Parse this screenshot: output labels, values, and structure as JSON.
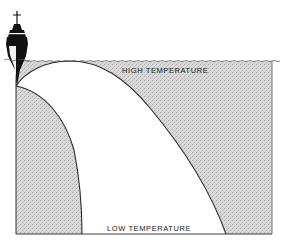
{
  "diagram": {
    "type": "sound-propagation-sketch",
    "labels": {
      "high_temperature": "HIGH TEMPERATURE",
      "low_temperature": "LOW TEMPERATURE"
    },
    "icons": {
      "ship": "warship-bow-icon"
    },
    "colors": {
      "shade_fill": "#d2d2d2",
      "line": "#2a2a2a",
      "background": "#ffffff",
      "ship": "#111111"
    }
  }
}
